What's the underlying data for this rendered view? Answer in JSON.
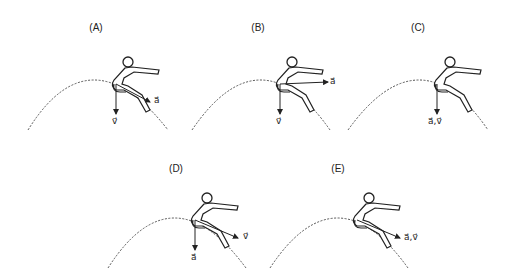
{
  "panels": [
    {
      "id": "A",
      "label": "(A)",
      "vector_label": "a⃗",
      "vector_label2": "v⃗",
      "description": "v down, a along slope"
    },
    {
      "id": "B",
      "label": "(B)",
      "vector_label": "a⃗",
      "vector_label2": "v⃗",
      "description": "v down, a horizontal right"
    },
    {
      "id": "C",
      "label": "(C)",
      "vector_label": "a⃗,v⃗",
      "description": "a and v both down"
    },
    {
      "id": "D",
      "label": "(D)",
      "vector_label": "a⃗",
      "vector_label2": "v⃗",
      "description": "a down, v along slope"
    },
    {
      "id": "E",
      "label": "(E)",
      "vector_label": "a⃗,v⃗",
      "description": "a and v both along slope"
    }
  ],
  "colors": {
    "line": "#222222",
    "curve": "#555555",
    "background": "#ffffff"
  }
}
